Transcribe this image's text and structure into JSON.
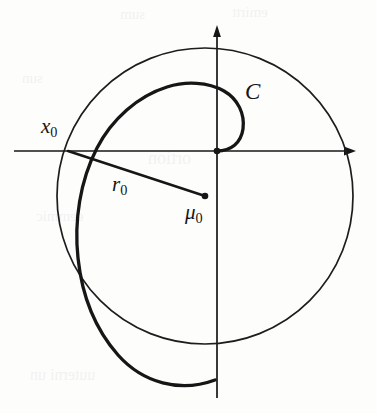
{
  "figure": {
    "type": "math-diagram",
    "background_color": "#fdfdfc",
    "ink_color": "#161616",
    "axes": {
      "horizontal": {
        "name": "horizontal-axis",
        "y": 151,
        "x_start": 14,
        "x_end": 356,
        "arrow": "right"
      },
      "vertical": {
        "name": "vertical-axis",
        "x": 217,
        "y_start": 398,
        "y_end": 25,
        "arrow": "up"
      },
      "origin": {
        "x": 217,
        "y": 151
      }
    },
    "labels": [
      {
        "id": "x0",
        "base": "x",
        "sub": "0",
        "x": 41,
        "y": 116,
        "font_size": 21,
        "italic": true
      },
      {
        "id": "r0",
        "base": "r",
        "sub": "0",
        "x": 112,
        "y": 174,
        "font_size": 21,
        "italic": true
      },
      {
        "id": "mu0",
        "base": "μ",
        "sub": "0",
        "x": 185,
        "y": 202,
        "font_size": 21,
        "italic": true
      },
      {
        "id": "C",
        "base": "C",
        "sub": "",
        "x": 245,
        "y": 80,
        "font_size": 23,
        "italic": true
      }
    ],
    "points": [
      {
        "name": "origin-point",
        "x": 217,
        "y": 151,
        "radius": 3.2
      },
      {
        "name": "center-point-mu0",
        "x": 205,
        "y": 196,
        "radius": 3.2
      },
      {
        "name": "point-x0",
        "x": 68,
        "y": 151,
        "radius": 0
      }
    ],
    "circle": {
      "name": "circle-r0",
      "center": {
        "x": 205,
        "y": 196
      },
      "radius": 148,
      "stroke_width": 1.6,
      "note": "circle through x0 centred at mu0, radius r0"
    },
    "radius_segment": {
      "name": "radius-segment-r0",
      "from": {
        "x": 68,
        "y": 151
      },
      "to": {
        "x": 205,
        "y": 196
      },
      "stroke_width": 2.4
    },
    "spiral": {
      "name": "spiral-curve-C",
      "stroke_width": 3.2,
      "start": {
        "x": 217,
        "y": 151
      },
      "end": {
        "x": 215,
        "y": 380
      },
      "turns": 1.6,
      "note": "outward-winding spiral starting at the origin, small inner loop labelled C in the first quadrant, terminating below on the vertical axis"
    },
    "ghost_text": [
      {
        "text": "sum",
        "x": 120,
        "y": 10,
        "size": 15
      },
      {
        "text": "emirtt",
        "x": 232,
        "y": 8,
        "size": 15
      },
      {
        "text": "sun",
        "x": 22,
        "y": 74,
        "size": 15
      },
      {
        "text": "ortion",
        "x": 148,
        "y": 152,
        "size": 18
      },
      {
        "text": "eemmic",
        "x": 36,
        "y": 212,
        "size": 15
      },
      {
        "text": "uuterni un",
        "x": 30,
        "y": 370,
        "size": 16
      }
    ]
  }
}
